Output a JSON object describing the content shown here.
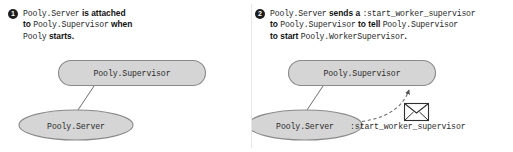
{
  "figure": {
    "background": "#ffffff",
    "node_fill": "#d5d5d5",
    "node_stroke": "#8a8a8a",
    "line_color": "#6f6f6f",
    "badge_fill": "#1d1d1d",
    "badge_text_color": "#ffffff",
    "text_color": "#1b1b1b"
  },
  "panels": [
    {
      "badge": "1",
      "caption_lines": [
        [
          {
            "text": "Pooly.Server",
            "style": "mono"
          },
          {
            "text": " is attached",
            "style": "word"
          }
        ],
        [
          {
            "text": "to ",
            "style": "word"
          },
          {
            "text": "Pooly.Supervisor",
            "style": "mono"
          },
          {
            "text": " when",
            "style": "word"
          }
        ],
        [
          {
            "text": "Pooly",
            "style": "mono"
          },
          {
            "text": " starts.",
            "style": "word"
          }
        ]
      ],
      "nodes": [
        {
          "name": "supervisor-node",
          "label": "Pooly.Supervisor",
          "shape": "rounded-rect"
        },
        {
          "name": "server-node",
          "label": "Pooly.Server",
          "shape": "ellipse"
        }
      ],
      "edges": [
        {
          "name": "attachment-link",
          "from": "server-node",
          "to": "supervisor-node",
          "style": "solid"
        }
      ]
    },
    {
      "badge": "2",
      "caption_lines": [
        [
          {
            "text": "Pooly.Server",
            "style": "mono"
          },
          {
            "text": " sends a ",
            "style": "word"
          },
          {
            "text": ":start_worker_supervisor",
            "style": "mono"
          }
        ],
        [
          {
            "text": "to ",
            "style": "word"
          },
          {
            "text": "Pooly.Supervisor",
            "style": "mono"
          },
          {
            "text": " to tell ",
            "style": "word"
          },
          {
            "text": "Pooly.Supervisor",
            "style": "mono"
          }
        ],
        [
          {
            "text": "to start ",
            "style": "word"
          },
          {
            "text": "Pooly.WorkerSupervisor",
            "style": "mono"
          },
          {
            "text": ".",
            "style": "word"
          }
        ]
      ],
      "nodes": [
        {
          "name": "supervisor-node",
          "label": "Pooly.Supervisor",
          "shape": "rounded-rect"
        },
        {
          "name": "server-node",
          "label": "Pooly.Server",
          "shape": "ellipse"
        }
      ],
      "edges": [
        {
          "name": "attachment-link",
          "from": "server-node",
          "to": "supervisor-node",
          "style": "solid"
        },
        {
          "name": "message-arrow",
          "from": "server-node",
          "to": "supervisor-node",
          "style": "dashed-arrow"
        }
      ],
      "message": {
        "icon": "envelope-icon",
        "label": ":start_worker_supervisor"
      }
    }
  ]
}
